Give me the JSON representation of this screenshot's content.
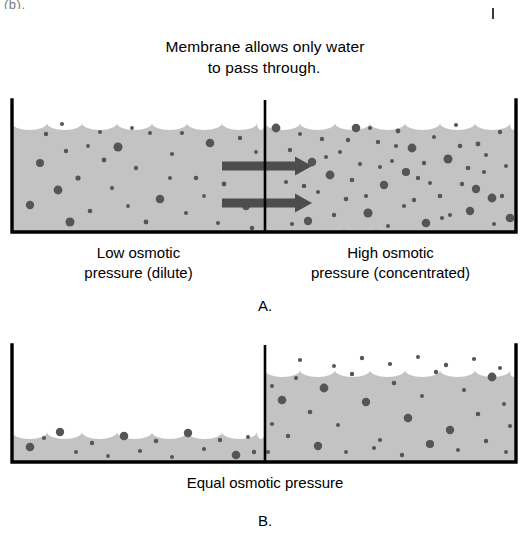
{
  "page": {
    "background": "#ffffff",
    "width": 530,
    "height": 537,
    "corner_artifact_text": "(b).",
    "title_line1": "Membrane allows only water",
    "title_line2": "to pass through",
    "title_line2_period": "."
  },
  "colors": {
    "solution_fill": "#c3c3c3",
    "solute_dot": "#555555",
    "wall": "#000000",
    "arrow": "#4d4d4d",
    "text": "#000000"
  },
  "panel_a": {
    "letter": "A.",
    "left_label_line1": "Low osmotic",
    "left_label_line2": "pressure (dilute)",
    "right_label_line1": "High osmotic",
    "right_label_line2": "pressure (concentrated)",
    "membrane_x": 265,
    "container_left": 12,
    "container_right": 516,
    "container_top": 100,
    "container_bottom": 232,
    "water_level_left": 116,
    "water_level_right": 116,
    "arrows": [
      {
        "name": "water-flow-arrow-top",
        "x1": 222,
        "x2": 312,
        "y": 166
      },
      {
        "name": "water-flow-arrow-bottom",
        "x1": 222,
        "x2": 312,
        "y": 203
      }
    ]
  },
  "panel_b": {
    "letter": "B.",
    "caption": "Equal osmotic pressure",
    "membrane_x": 265,
    "container_left": 12,
    "container_right": 516,
    "container_top": 345,
    "container_bottom": 462,
    "water_level_left": 425,
    "water_level_right": 363
  },
  "chart_data": {
    "type": "diagram",
    "panels": [
      {
        "id": "A",
        "description": "Before osmosis: equal water levels, unequal solute concentration, water flows from dilute to concentrated side.",
        "left_compartment": {
          "concentration": "dilute",
          "osmotic_pressure": "low",
          "solute_dot_count": 34
        },
        "right_compartment": {
          "concentration": "concentrated",
          "osmotic_pressure": "high",
          "solute_dot_count": 62
        },
        "net_water_flow": "left-to-right",
        "arrow_count": 2
      },
      {
        "id": "B",
        "description": "After osmosis: water has moved right, raising right level and lowering left level; osmotic pressures equal.",
        "left_compartment": {
          "concentration": "dilute",
          "osmotic_pressure": "equal",
          "solute_dot_count": 16
        },
        "right_compartment": {
          "concentration": "concentrated",
          "osmotic_pressure": "equal",
          "solute_dot_count": 38
        },
        "net_water_flow": "none",
        "arrow_count": 0
      }
    ]
  },
  "solute_dots_a_left": [
    [
      30,
      205,
      4.2
    ],
    [
      46,
      134,
      2.2
    ],
    [
      62,
      124,
      2.0
    ],
    [
      78,
      178,
      2.6
    ],
    [
      88,
      146,
      1.9
    ],
    [
      40,
      163,
      4.0
    ],
    [
      58,
      190,
      4.4
    ],
    [
      70,
      222,
      4.5
    ],
    [
      90,
      211,
      2.3
    ],
    [
      104,
      160,
      2.4
    ],
    [
      118,
      147,
      4.5
    ],
    [
      112,
      188,
      2.1
    ],
    [
      128,
      206,
      1.9
    ],
    [
      136,
      168,
      2.2
    ],
    [
      150,
      133,
      2.0
    ],
    [
      146,
      222,
      2.4
    ],
    [
      160,
      199,
      4.3
    ],
    [
      172,
      154,
      2.1
    ],
    [
      186,
      213,
      2.0
    ],
    [
      196,
      178,
      2.3
    ],
    [
      210,
      143,
      4.3
    ],
    [
      204,
      196,
      1.9
    ],
    [
      218,
      223,
      2.1
    ],
    [
      232,
      168,
      2.0
    ],
    [
      240,
      138,
      2.2
    ],
    [
      246,
      206,
      4.2
    ],
    [
      256,
      152,
      1.9
    ],
    [
      224,
      184,
      2.4
    ],
    [
      170,
      178,
      2.0
    ],
    [
      100,
      132,
      2.0
    ],
    [
      66,
      151,
      2.2
    ],
    [
      132,
      128,
      1.9
    ],
    [
      182,
      133,
      2.1
    ],
    [
      252,
      228,
      2.3
    ]
  ],
  "solute_dots_a_right": [
    [
      276,
      128,
      4.4
    ],
    [
      290,
      150,
      2.2
    ],
    [
      300,
      134,
      2.0
    ],
    [
      312,
      162,
      4.3
    ],
    [
      286,
      182,
      2.1
    ],
    [
      296,
      205,
      2.4
    ],
    [
      308,
      221,
      4.2
    ],
    [
      322,
      139,
      2.2
    ],
    [
      330,
      175,
      4.4
    ],
    [
      340,
      152,
      2.0
    ],
    [
      346,
      199,
      2.3
    ],
    [
      356,
      128,
      4.3
    ],
    [
      360,
      164,
      2.1
    ],
    [
      368,
      213,
      4.5
    ],
    [
      378,
      142,
      2.2
    ],
    [
      384,
      185,
      4.2
    ],
    [
      392,
      161,
      2.0
    ],
    [
      398,
      131,
      2.4
    ],
    [
      404,
      206,
      2.1
    ],
    [
      412,
      148,
      4.4
    ],
    [
      418,
      178,
      2.2
    ],
    [
      426,
      223,
      4.3
    ],
    [
      434,
      137,
      2.1
    ],
    [
      440,
      196,
      2.3
    ],
    [
      448,
      159,
      4.5
    ],
    [
      456,
      125,
      2.0
    ],
    [
      462,
      184,
      2.2
    ],
    [
      470,
      211,
      4.2
    ],
    [
      478,
      144,
      2.4
    ],
    [
      484,
      172,
      2.1
    ],
    [
      492,
      198,
      4.4
    ],
    [
      500,
      132,
      2.2
    ],
    [
      506,
      166,
      2.0
    ],
    [
      510,
      218,
      4.3
    ],
    [
      318,
      192,
      2.0
    ],
    [
      334,
      215,
      2.2
    ],
    [
      352,
      180,
      2.3
    ],
    [
      370,
      128,
      2.1
    ],
    [
      388,
      226,
      2.0
    ],
    [
      406,
      172,
      4.1
    ],
    [
      424,
      163,
      2.2
    ],
    [
      442,
      218,
      2.1
    ],
    [
      460,
      146,
      2.3
    ],
    [
      476,
      189,
      4.2
    ],
    [
      494,
      224,
      2.0
    ],
    [
      282,
      164,
      2.1
    ],
    [
      304,
      186,
      2.3
    ],
    [
      326,
      157,
      2.0
    ],
    [
      348,
      140,
      2.2
    ],
    [
      366,
      196,
      2.1
    ],
    [
      380,
      167,
      2.0
    ],
    [
      396,
      146,
      2.1
    ],
    [
      414,
      200,
      2.2
    ],
    [
      430,
      183,
      2.0
    ],
    [
      450,
      215,
      2.1
    ],
    [
      468,
      168,
      2.3
    ],
    [
      486,
      155,
      2.0
    ],
    [
      502,
      196,
      2.2
    ],
    [
      292,
      224,
      2.1
    ],
    [
      344,
      232,
      1.9
    ],
    [
      376,
      232,
      1.9
    ],
    [
      422,
      234,
      1.9
    ]
  ],
  "solute_dots_b_left": [
    [
      30,
      447,
      4.3
    ],
    [
      44,
      438,
      2.1
    ],
    [
      60,
      432,
      4.2
    ],
    [
      76,
      452,
      2.0
    ],
    [
      92,
      443,
      2.2
    ],
    [
      108,
      456,
      1.9
    ],
    [
      124,
      436,
      4.3
    ],
    [
      140,
      451,
      2.1
    ],
    [
      156,
      441,
      2.3
    ],
    [
      172,
      457,
      2.0
    ],
    [
      188,
      433,
      4.2
    ],
    [
      204,
      449,
      2.1
    ],
    [
      220,
      440,
      2.2
    ],
    [
      236,
      455,
      4.3
    ],
    [
      248,
      437,
      2.0
    ],
    [
      254,
      452,
      2.2
    ]
  ],
  "solute_dots_b_right": [
    [
      282,
      400,
      4.3
    ],
    [
      296,
      378,
      2.1
    ],
    [
      310,
      412,
      2.3
    ],
    [
      324,
      388,
      4.4
    ],
    [
      338,
      425,
      2.0
    ],
    [
      352,
      374,
      2.2
    ],
    [
      366,
      402,
      4.2
    ],
    [
      380,
      440,
      2.1
    ],
    [
      394,
      383,
      2.3
    ],
    [
      408,
      418,
      4.3
    ],
    [
      422,
      396,
      2.0
    ],
    [
      436,
      372,
      2.2
    ],
    [
      450,
      430,
      4.2
    ],
    [
      464,
      390,
      2.1
    ],
    [
      478,
      414,
      2.3
    ],
    [
      492,
      377,
      4.4
    ],
    [
      504,
      404,
      2.0
    ],
    [
      288,
      436,
      2.2
    ],
    [
      318,
      446,
      4.2
    ],
    [
      346,
      452,
      2.0
    ],
    [
      374,
      448,
      2.1
    ],
    [
      402,
      455,
      2.2
    ],
    [
      430,
      444,
      4.1
    ],
    [
      458,
      450,
      2.0
    ],
    [
      486,
      441,
      2.2
    ],
    [
      506,
      452,
      2.0
    ],
    [
      300,
      360,
      2.1
    ],
    [
      334,
      366,
      2.0
    ],
    [
      362,
      358,
      2.2
    ],
    [
      390,
      364,
      2.1
    ],
    [
      418,
      357,
      2.0
    ],
    [
      446,
      365,
      2.2
    ],
    [
      474,
      359,
      2.1
    ],
    [
      500,
      368,
      2.0
    ],
    [
      272,
      424,
      2.1
    ],
    [
      272,
      386,
      2.0
    ],
    [
      510,
      426,
      2.1
    ],
    [
      268,
      452,
      2.0
    ]
  ]
}
